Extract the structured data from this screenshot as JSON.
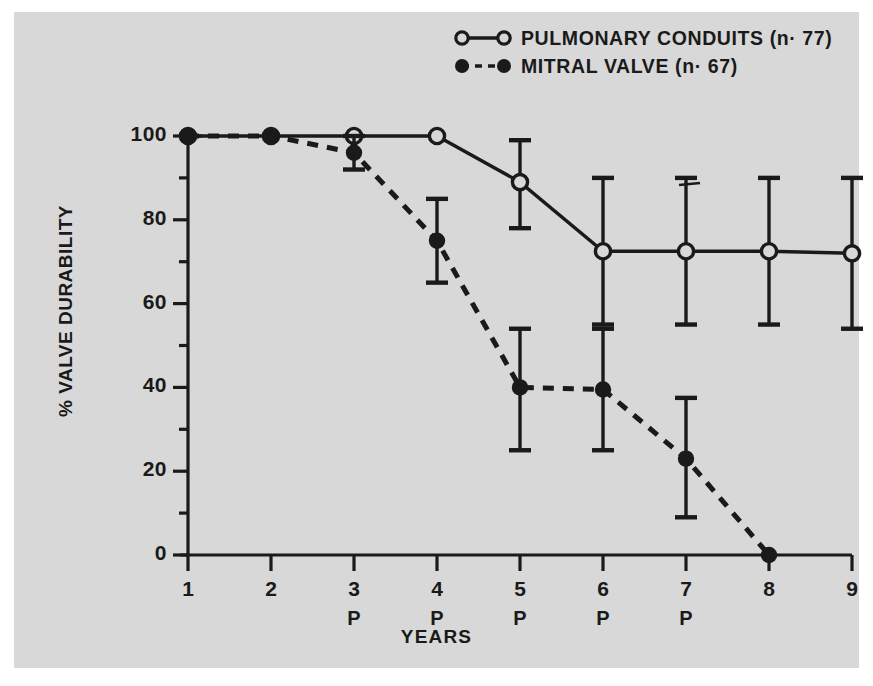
{
  "figure": {
    "background_color": "#ffffff",
    "panel_color": "#d8d8d8",
    "ink_color": "#1a1a1a"
  },
  "chart_data": {
    "type": "line",
    "title": "",
    "xlabel": "YEARS",
    "ylabel": "% VALVE DURABILITY",
    "xlim": [
      1,
      9
    ],
    "ylim": [
      0,
      100
    ],
    "yticks": [
      0,
      20,
      40,
      60,
      80,
      100
    ],
    "ytick_labels": [
      "0",
      "20",
      "40",
      "60",
      "80",
      "100"
    ],
    "yminorticks": [
      10,
      30,
      50,
      70,
      90
    ],
    "xticks": [
      1,
      2,
      3,
      4,
      5,
      6,
      7,
      8,
      9
    ],
    "xtick_labels": [
      "1",
      "2",
      "3",
      "4",
      "5",
      "6",
      "7",
      "8",
      "9"
    ],
    "xtick_sublabels": [
      "",
      "",
      "P",
      "P",
      "P",
      "P",
      "P",
      "",
      ""
    ],
    "grid": false,
    "legend_position": "top-right",
    "series": [
      {
        "name": "PULMONARY CONDUITS (n=77)",
        "legend_label": "PULMONARY CONDUITS (n· 77)",
        "marker": "open-circle",
        "linestyle": "solid",
        "x": [
          1,
          2,
          3,
          4,
          5,
          6,
          7,
          8,
          9
        ],
        "values": [
          100,
          100,
          100,
          100,
          89,
          72.5,
          72.5,
          72.5,
          72
        ],
        "err_upper": [
          0,
          0,
          0,
          0,
          10,
          17.5,
          17.5,
          17.5,
          18
        ],
        "err_lower": [
          0,
          0,
          0,
          0,
          11,
          17.5,
          17.5,
          17.5,
          18
        ]
      },
      {
        "name": "MITRAL VALVE (n=67)",
        "legend_label": "MITRAL VALVE (n· 67)",
        "marker": "filled-circle",
        "linestyle": "dashed",
        "x": [
          1,
          2,
          3,
          4,
          5,
          6,
          7,
          8
        ],
        "values": [
          100,
          100,
          96,
          75,
          40,
          39.5,
          23,
          0
        ],
        "err_upper": [
          0,
          0,
          4,
          10,
          14,
          14.5,
          14.5,
          0
        ],
        "err_lower": [
          0,
          0,
          4,
          10,
          15,
          14.5,
          14,
          0
        ]
      }
    ]
  },
  "legend": {
    "entries": [
      {
        "label": "PULMONARY CONDUITS (n· 77)",
        "marker": "open-circle",
        "linestyle": "solid"
      },
      {
        "label": "MITRAL VALVE (n· 67)",
        "marker": "filled-circle",
        "linestyle": "dashed"
      }
    ]
  },
  "axes": {
    "y_title": "% VALVE DURABILITY",
    "x_title": "YEARS"
  }
}
